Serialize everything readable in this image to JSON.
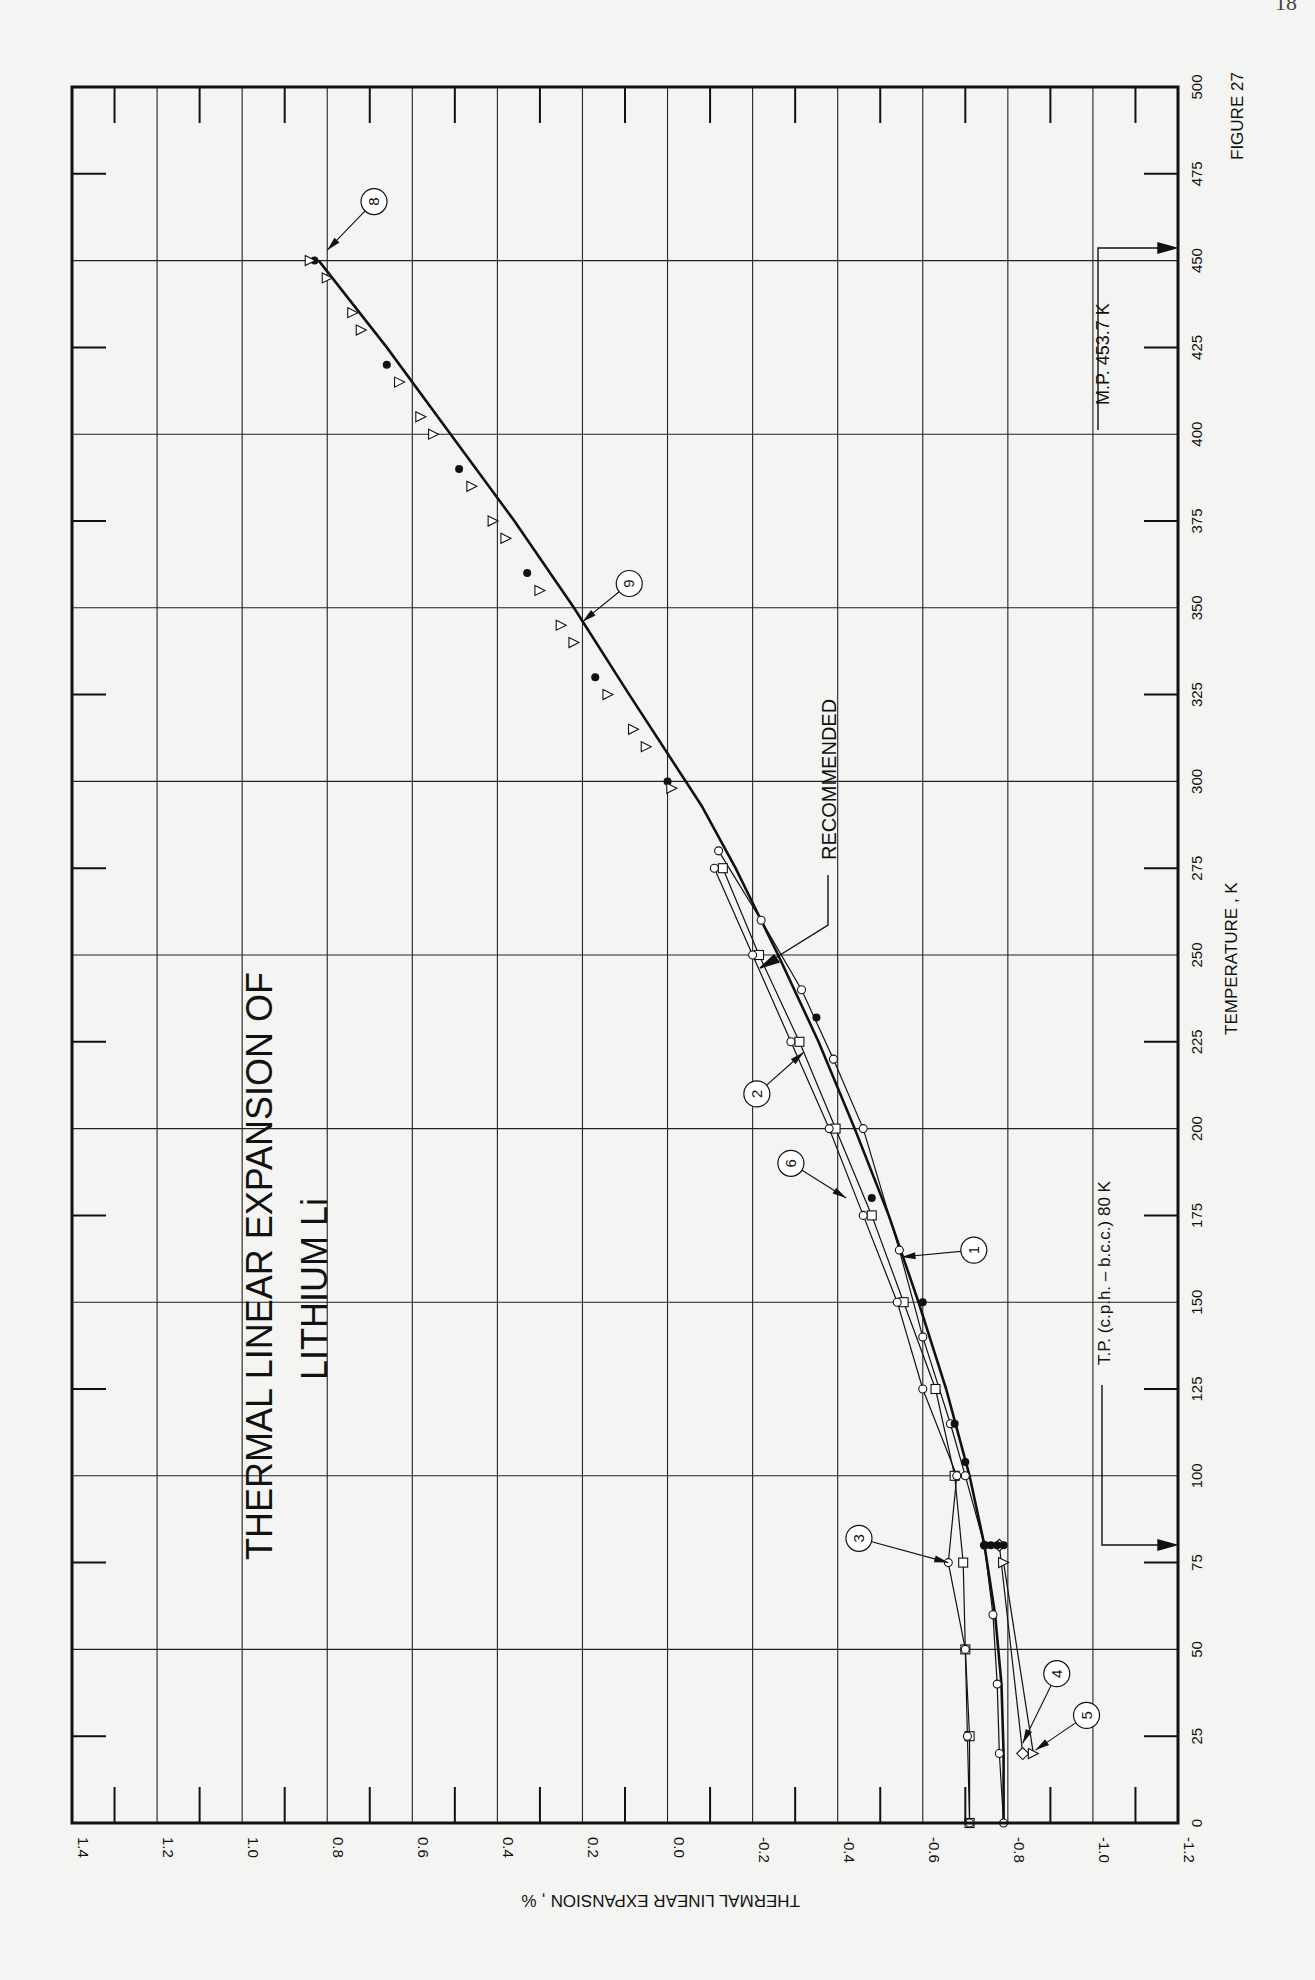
{
  "page": {
    "page_number_partial": "18"
  },
  "figure_label": "FIGURE 27",
  "chart_data": {
    "type": "line",
    "title": "THERMAL LINEAR EXPANSION OF",
    "subtitle": "LITHIUM  Li",
    "orientation": "rotated-90",
    "xlabel": "TEMPERATURE , K",
    "ylabel": "THERMAL  LINEAR  EXPANSION , %",
    "xlim": [
      0,
      500
    ],
    "ylim": [
      -1.2,
      1.4
    ],
    "x_ticks": [
      0,
      25,
      50,
      75,
      100,
      125,
      150,
      175,
      200,
      225,
      250,
      275,
      300,
      325,
      350,
      375,
      400,
      425,
      450,
      475,
      500
    ],
    "x_tick_labels": [
      "0",
      "25",
      "50",
      "75",
      "100",
      "125",
      "150",
      "175",
      "200",
      "225",
      "250",
      "275",
      "300",
      "325",
      "350",
      "375",
      "400",
      "425",
      "450",
      "475",
      "500"
    ],
    "y_ticks": [
      1.4,
      1.2,
      1.0,
      0.8,
      0.6,
      0.4,
      0.2,
      0.0,
      -0.2,
      -0.4,
      -0.6,
      -0.8,
      -1.0,
      -1.2
    ],
    "y_tick_labels": [
      "1.4",
      "1.2",
      "1.0",
      "0.8",
      "0.6",
      "0.4",
      "0.2",
      "0.0",
      "-0.2",
      "-0.4",
      "-0.6",
      "-0.8",
      "-1.0",
      "-1.2"
    ],
    "grid": true,
    "annotations": [
      {
        "text": "M.P. 453.7  K",
        "x": 453.7
      },
      {
        "text": "T.P. (c.p.h. – b.c.c.)  80  K",
        "x": 80
      },
      {
        "text": "RECOMMENDED",
        "x": 245,
        "y": -0.24
      }
    ],
    "series": [
      {
        "name": "RECOMMENDED",
        "marker": "none",
        "width": 2.6,
        "x": [
          0,
          20,
          40,
          60,
          80,
          100,
          125,
          150,
          175,
          200,
          225,
          250,
          275,
          293,
          325,
          350,
          375,
          400,
          425,
          450
        ],
        "y": [
          -0.79,
          -0.79,
          -0.785,
          -0.77,
          -0.745,
          -0.71,
          -0.655,
          -0.59,
          -0.52,
          -0.44,
          -0.355,
          -0.26,
          -0.16,
          -0.08,
          0.09,
          0.22,
          0.36,
          0.51,
          0.66,
          0.82
        ]
      },
      {
        "name": "1",
        "marker": "circle-open",
        "x": [
          0,
          20,
          40,
          60,
          80,
          100,
          115,
          140,
          165,
          200,
          220,
          240,
          260,
          280
        ],
        "y": [
          -0.79,
          -0.78,
          -0.775,
          -0.765,
          -0.745,
          -0.7,
          -0.665,
          -0.6,
          -0.545,
          -0.46,
          -0.39,
          -0.315,
          -0.22,
          -0.12
        ]
      },
      {
        "name": "2",
        "marker": "square-open",
        "x": [
          0,
          25,
          50,
          75,
          100,
          125,
          150,
          175,
          200,
          225,
          250,
          275
        ],
        "y": [
          -0.71,
          -0.71,
          -0.7,
          -0.695,
          -0.675,
          -0.63,
          -0.555,
          -0.48,
          -0.395,
          -0.31,
          -0.215,
          -0.13
        ]
      },
      {
        "name": "3",
        "marker": "circle-open",
        "x": [
          0,
          25,
          50,
          75,
          100,
          125,
          150,
          175,
          200,
          225,
          250,
          275
        ],
        "y": [
          -0.71,
          -0.705,
          -0.7,
          -0.66,
          -0.68,
          -0.6,
          -0.54,
          -0.46,
          -0.38,
          -0.29,
          -0.2,
          -0.11
        ]
      },
      {
        "name": "4",
        "marker": "diamond-open",
        "x": [
          20,
          80
        ],
        "y": [
          -0.835,
          -0.78
        ]
      },
      {
        "name": "5",
        "marker": "triangle-open",
        "x": [
          20,
          75
        ],
        "y": [
          -0.86,
          -0.79
        ]
      },
      {
        "name": "6",
        "marker": "circle-filled",
        "x": [
          80,
          80,
          80,
          80,
          104,
          115,
          150,
          180,
          232
        ],
        "y": [
          -0.745,
          -0.76,
          -0.775,
          -0.79,
          -0.7,
          -0.675,
          -0.6,
          -0.48,
          -0.35
        ]
      },
      {
        "name": "8",
        "marker": "mixed-filled-open-triangle",
        "x": [
          300,
          315,
          330,
          345,
          360,
          375,
          390,
          405,
          420,
          435,
          450
        ],
        "y": [
          0.0,
          0.08,
          0.17,
          0.25,
          0.33,
          0.41,
          0.49,
          0.58,
          0.66,
          0.74,
          0.83
        ]
      },
      {
        "name": "9",
        "marker": "triangle-open",
        "x": [
          298,
          310,
          325,
          340,
          355,
          370,
          385,
          400,
          415,
          430,
          445,
          450
        ],
        "y": [
          -0.01,
          0.05,
          0.14,
          0.22,
          0.3,
          0.38,
          0.46,
          0.55,
          0.63,
          0.72,
          0.8,
          0.84
        ]
      }
    ],
    "curve_labels": [
      {
        "id": "1",
        "cx": 165,
        "cy": -0.72,
        "ax": 163,
        "ay": -0.55
      },
      {
        "id": "2",
        "cx": 210,
        "cy": -0.21,
        "ax": 222,
        "ay": -0.32
      },
      {
        "id": "3",
        "cx": 82,
        "cy": -0.45,
        "ax": 75,
        "ay": -0.66
      },
      {
        "id": "4",
        "cx": 43,
        "cy": -0.915,
        "ax": 23,
        "ay": -0.835
      },
      {
        "id": "5",
        "cx": 31,
        "cy": -0.985,
        "ax": 21,
        "ay": -0.865
      },
      {
        "id": "6",
        "cx": 190,
        "cy": -0.29,
        "ax": 180,
        "ay": -0.42
      },
      {
        "id": "8",
        "cx": 467,
        "cy": 0.69,
        "ax": 453,
        "ay": 0.8
      },
      {
        "id": "9",
        "cx": 357,
        "cy": 0.09,
        "ax": 346,
        "ay": 0.2
      }
    ]
  }
}
